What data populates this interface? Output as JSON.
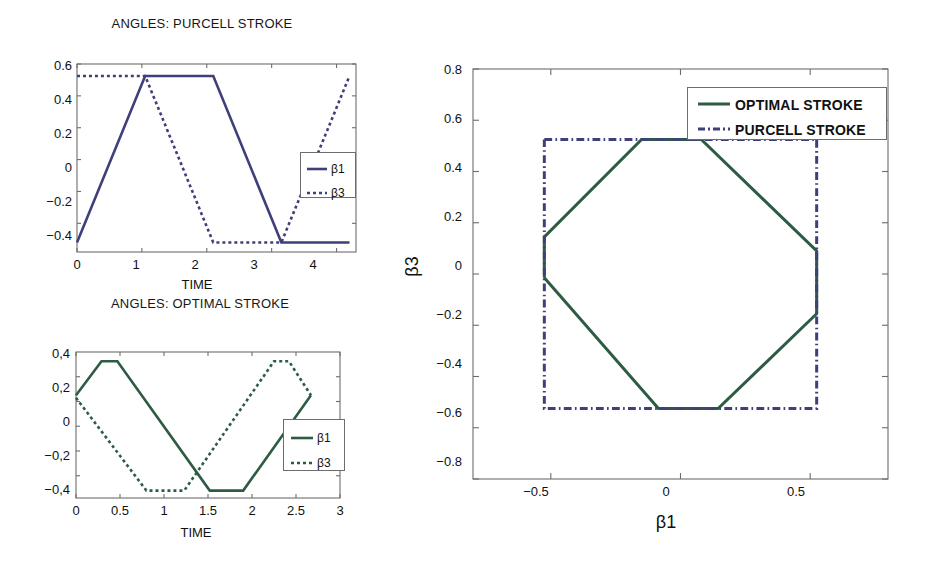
{
  "figure": {
    "background": "#ffffff",
    "colors": {
      "purcell": "#3f3f7a",
      "optimal": "#2d5c43",
      "axis": "#6d6d6d",
      "text": "#111111"
    }
  },
  "chart_data": [
    {
      "id": "angles-purcell-stroke",
      "type": "line",
      "title": "ANGLES: PURCELL STROKE",
      "xlabel": "TIME",
      "ylabel": "",
      "xlim": [
        0,
        4.3
      ],
      "ylim": [
        -0.58,
        0.6
      ],
      "xticks": [
        "0",
        "1",
        "2",
        "3",
        "4"
      ],
      "xtick_values": [
        0,
        1,
        2,
        3,
        4
      ],
      "yticks": [
        "0.6",
        "0.4",
        "0.2",
        "0",
        "-0.2",
        "-0.4"
      ],
      "ytick_values": [
        0.6,
        0.4,
        0.2,
        0,
        -0.2,
        -0.4
      ],
      "grid": false,
      "legend_position": "right",
      "series": [
        {
          "name": "β1",
          "style": "solid",
          "color": "#3f3f7a",
          "x": [
            0,
            1.05,
            2.1,
            3.15,
            4.2
          ],
          "y": [
            -0.52,
            0.525,
            0.525,
            -0.52,
            -0.52
          ]
        },
        {
          "name": "β3",
          "style": "dotted",
          "color": "#3f3f7a",
          "x": [
            0,
            1.05,
            2.1,
            3.15,
            4.2
          ],
          "y": [
            0.525,
            0.525,
            -0.52,
            -0.52,
            0.525
          ]
        }
      ]
    },
    {
      "id": "angles-optimal-stroke",
      "type": "line",
      "title": "ANGLES: OPTIMAL STROKE",
      "xlabel": "TIME",
      "ylabel": "",
      "xlim": [
        0,
        3
      ],
      "ylim": [
        -0.58,
        0.6
      ],
      "xticks": [
        "0",
        "0.5",
        "1",
        "1.5",
        "2",
        "2.5",
        "3"
      ],
      "xtick_values": [
        0,
        0.5,
        1,
        1.5,
        2,
        2.5,
        3
      ],
      "yticks": [
        "0,4",
        "0,2",
        "0",
        "-0,2",
        "-0,4"
      ],
      "ytick_values": [
        0.4,
        0.2,
        0,
        -0.2,
        -0.4
      ],
      "grid": false,
      "legend_position": "right",
      "series": [
        {
          "name": "β1",
          "style": "solid",
          "color": "#2d5c43",
          "x": [
            0,
            0.29,
            0.47,
            1.52,
            1.9,
            2.67
          ],
          "y": [
            0.25,
            0.525,
            0.525,
            -0.52,
            -0.52,
            0.25
          ]
        },
        {
          "name": "β3",
          "style": "dotted",
          "color": "#2d5c43",
          "x": [
            0,
            0.8,
            1.23,
            2.25,
            2.42,
            2.67
          ],
          "y": [
            0.23,
            -0.52,
            -0.52,
            0.525,
            0.525,
            0.25
          ]
        }
      ]
    },
    {
      "id": "phase-plane-beta1-beta3",
      "type": "line",
      "title": "",
      "xlabel": "β1",
      "ylabel": "β3",
      "xlim": [
        -0.8,
        0.8
      ],
      "ylim": [
        -0.8,
        0.8
      ],
      "xticks": [
        "-0.5",
        "0",
        "0.5"
      ],
      "xtick_values": [
        -0.5,
        0,
        0.5
      ],
      "yticks": [
        "0.8",
        "0.6",
        "0.4",
        "0.2",
        "0",
        "-0.2",
        "-0.4",
        "-0.6",
        "-0.8"
      ],
      "ytick_values": [
        0.8,
        0.6,
        0.4,
        0.2,
        0,
        -0.2,
        -0.4,
        -0.6,
        -0.8
      ],
      "grid": false,
      "legend_position": "upper right",
      "series": [
        {
          "name": "OPTIMAL STROKE",
          "style": "solid",
          "color": "#2d5c43",
          "x": [
            -0.525,
            -0.525,
            -0.15,
            0.08,
            0.525,
            0.525,
            0.145,
            -0.085,
            -0.525
          ],
          "y": [
            -0.015,
            0.145,
            0.525,
            0.525,
            0.09,
            -0.155,
            -0.525,
            -0.525,
            -0.015
          ]
        },
        {
          "name": "PURCELL STROKE",
          "style": "dashdot",
          "color": "#3f3f7a",
          "x": [
            -0.525,
            0.525,
            0.525,
            -0.525,
            -0.525
          ],
          "y": [
            0.525,
            0.525,
            -0.525,
            -0.525,
            0.525
          ]
        }
      ]
    }
  ],
  "panels": {
    "purcell": {
      "title": "ANGLES: PURCELL STROKE",
      "xlabel": "TIME",
      "xticks": [
        "0",
        "1",
        "2",
        "3",
        "4"
      ],
      "yticks": [
        "0.6",
        "0.4",
        "0.2",
        "0",
        "−0.2",
        "−0.4"
      ],
      "legend": [
        {
          "label": "β1",
          "style": "solid"
        },
        {
          "label": "β3",
          "style": "dotted"
        }
      ]
    },
    "optimal": {
      "title": "ANGLES: OPTIMAL STROKE",
      "xlabel": "TIME",
      "xticks": [
        "0",
        "0.5",
        "1",
        "1.5",
        "2",
        "2.5",
        "3"
      ],
      "yticks": [
        "0,4",
        "0,2",
        "0",
        "−0,2",
        "−0,4"
      ],
      "legend": [
        {
          "label": "β1",
          "style": "solid"
        },
        {
          "label": "β3",
          "style": "dotted"
        }
      ]
    },
    "phase": {
      "xlabel": "β1",
      "ylabel": "β3",
      "xticks": [
        "−0.5",
        "0",
        "0.5"
      ],
      "yticks": [
        "0.8",
        "0.6",
        "0.4",
        "0.2",
        "0",
        "−0.2",
        "−0.4",
        "−0.6",
        "−0.8"
      ],
      "legend": [
        {
          "label": "OPTIMAL STROKE",
          "style": "solid"
        },
        {
          "label": "PURCELL STROKE",
          "style": "dashdot"
        }
      ]
    }
  }
}
